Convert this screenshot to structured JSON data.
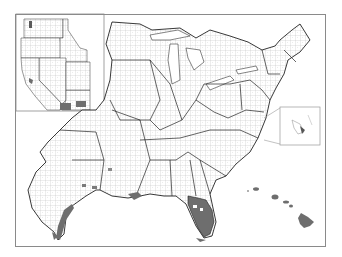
{
  "map": {
    "type": "choropleth",
    "subject": "United States county map (eastern US with West inset)",
    "insets": [
      "Western US (CA, OR, WA, NV, ID, AZ)",
      "Hawaii",
      "DC / Chesapeake area"
    ],
    "colors": {
      "background": "#ffffff",
      "county_border": "#b0b0b0",
      "state_border": "#222222",
      "highlight": "#6e6e6e",
      "frame": "#8a8a8a"
    },
    "highlighted_regions": [
      "Florida (most counties)",
      "Hawaii",
      "Southern Arizona counties",
      "Southern California coast",
      "Gulf coast of Texas",
      "Louisiana coast",
      "Puget Sound, Washington",
      "San Francisco Bay area"
    ]
  }
}
